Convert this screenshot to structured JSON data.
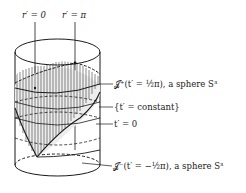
{
  "figure": {
    "top_labels": {
      "r_zero": "r′ = 0",
      "r_pi": "r′ = π"
    },
    "annotations": {
      "scri_plus": "𝒥⁺(t′ = ½π), a sphere S³",
      "t_const": "{t′ = constant}",
      "t_zero": "t′ = 0",
      "scri_minus": "𝒥⁻(t′ = −½π), a sphere S³"
    },
    "colors": {
      "ink": "#1a1a1a",
      "hatch": "#3a3a3a",
      "background": "#ffffff"
    }
  }
}
